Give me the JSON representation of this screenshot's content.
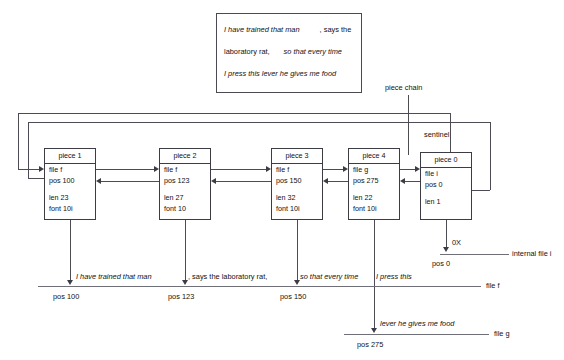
{
  "quote": {
    "line1_italic": "I have trained that man",
    "line1_roman": ", says the",
    "line2_roman": "laboratory rat,",
    "line2_italic": "so that every time",
    "line3_italic": "I press this lever he gives me food"
  },
  "labels": {
    "piece_chain": "piece chain",
    "sentinel": "sentinel",
    "internal_file": "internal file i",
    "zero_x": "0X"
  },
  "pieces": [
    {
      "title": "piece 1",
      "file": "file f",
      "pos": "pos 100",
      "len": "len 23",
      "font": "font 10i"
    },
    {
      "title": "piece 2",
      "file": "file f",
      "pos": "pos 123",
      "len": "len 27",
      "font": "font 10"
    },
    {
      "title": "piece 3",
      "file": "file f",
      "pos": "pos 150",
      "len": "len 32",
      "font": "font 10i"
    },
    {
      "title": "piece 4",
      "file": "file g",
      "pos": "pos 275",
      "len": "len 22",
      "font": "font 10i"
    },
    {
      "title": "piece 0",
      "file": "file i",
      "pos": "pos 0",
      "len": "len 1",
      "font": ""
    }
  ],
  "file_f_line": {
    "name": "file f",
    "segments": [
      {
        "text": "I have trained that man",
        "style": "italic"
      },
      {
        "text": ", says the laboratory rat,",
        "style": "roman"
      },
      {
        "text": "so that every time",
        "style": "italic"
      },
      {
        "text": "I press this",
        "style": "italic"
      }
    ],
    "positions": [
      "pos 100",
      "pos 123",
      "pos 150"
    ]
  },
  "file_g_line": {
    "name": "file g",
    "segment": "lever he gives me food",
    "position": "pos 275"
  },
  "internal_file_line": {
    "name": "internal file i",
    "marker": "0X",
    "position": "pos 0"
  }
}
